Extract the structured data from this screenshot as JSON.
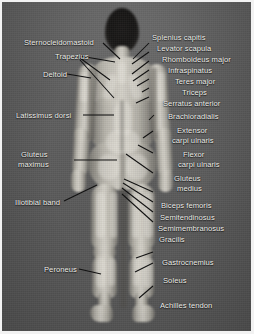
{
  "figure": {
    "view": "posterior",
    "background_color": "#5f5f5f",
    "label_color": "#f4f4f0",
    "leader_line_color": "#111111"
  },
  "labels_left": [
    {
      "id": "sternocleidomastoid",
      "text": "Sternocleidomastoid"
    },
    {
      "id": "trapezius",
      "text": "Trapezius"
    },
    {
      "id": "deltoid",
      "text": "Deltoid"
    },
    {
      "id": "latissimus-dorsi",
      "text": "Latissimus dorsi"
    },
    {
      "id": "gluteus-maximus-1",
      "text": "Gluteus"
    },
    {
      "id": "gluteus-maximus-2",
      "text": "maximus"
    },
    {
      "id": "iliotibial-band",
      "text": "Iliotibial band"
    },
    {
      "id": "peroneus",
      "text": "Peroneus"
    }
  ],
  "labels_right": [
    {
      "id": "splenius-capitis",
      "text": "Splenius capitis"
    },
    {
      "id": "levator-scapula",
      "text": "Levator scapula"
    },
    {
      "id": "rhomboideus-major",
      "text": "Rhomboideus major"
    },
    {
      "id": "infraspinatus",
      "text": "Infraspinatus"
    },
    {
      "id": "teres-major",
      "text": "Teres major"
    },
    {
      "id": "triceps",
      "text": "Triceps"
    },
    {
      "id": "serratus-anterior",
      "text": "Serratus anterior"
    },
    {
      "id": "brachioradialis",
      "text": "Brachioradialis"
    },
    {
      "id": "extensor-carpi-1",
      "text": "Extensor"
    },
    {
      "id": "extensor-carpi-2",
      "text": "carpi ulnaris"
    },
    {
      "id": "flexor-carpi-1",
      "text": "Flexor"
    },
    {
      "id": "flexor-carpi-2",
      "text": "carpi ulnaris"
    },
    {
      "id": "gluteus-medius-1",
      "text": "Gluteus"
    },
    {
      "id": "gluteus-medius-2",
      "text": "medius"
    },
    {
      "id": "biceps-femoris",
      "text": "Biceps femoris"
    },
    {
      "id": "semitendinosus",
      "text": "Semitendinosus"
    },
    {
      "id": "semimembranosus",
      "text": "Semimembranosus"
    },
    {
      "id": "gracilis",
      "text": "Gracilis"
    },
    {
      "id": "gastrocnemius",
      "text": "Gastrocnemius"
    },
    {
      "id": "soleus",
      "text": "Soleus"
    },
    {
      "id": "achilles-tendon",
      "text": "Achilles tendon"
    }
  ]
}
